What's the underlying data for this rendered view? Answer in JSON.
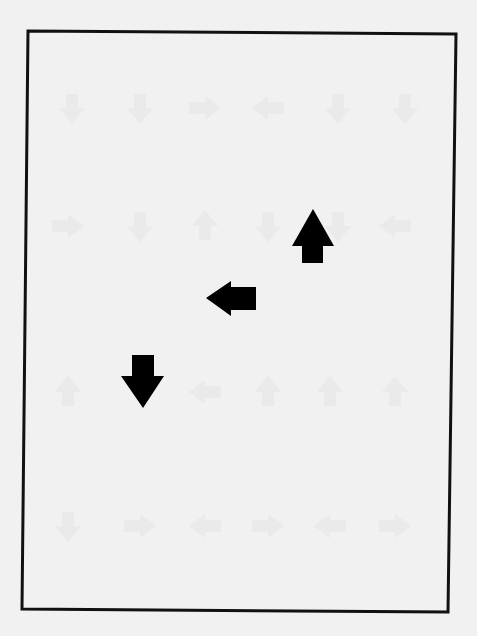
{
  "page": {
    "background": "#f1f1f1",
    "frame": {
      "stroke": "#111111",
      "stroke_width": 3,
      "corners": [
        [
          28,
          31
        ],
        [
          456,
          34
        ],
        [
          448,
          612
        ],
        [
          22,
          609
        ]
      ]
    },
    "arrows": [
      {
        "name": "up-arrow",
        "direction": "up",
        "color": "#000000",
        "points": "313,209 334,246 323,246 323,263 302,263 302,246 292,246"
      },
      {
        "name": "left-arrow",
        "direction": "left",
        "color": "#000000",
        "points": "206,298 231,281 231,287 256,287 256,310 231,310 231,316"
      },
      {
        "name": "down-arrow",
        "direction": "down",
        "color": "#000000",
        "points": "132,355 154,355 154,376 164,376 143,408 121,376 132,376"
      }
    ],
    "ghost_marks": {
      "color": "#e3e3e3",
      "rows": [
        {
          "y": 108,
          "items": [
            {
              "x": 72,
              "dir": "down"
            },
            {
              "x": 140,
              "dir": "down"
            },
            {
              "x": 205,
              "dir": "right"
            },
            {
              "x": 268,
              "dir": "left"
            },
            {
              "x": 338,
              "dir": "down"
            },
            {
              "x": 405,
              "dir": "down"
            }
          ]
        },
        {
          "y": 226,
          "items": [
            {
              "x": 68,
              "dir": "right"
            },
            {
              "x": 140,
              "dir": "down"
            },
            {
              "x": 205,
              "dir": "up"
            },
            {
              "x": 268,
              "dir": "down"
            },
            {
              "x": 338,
              "dir": "down"
            },
            {
              "x": 395,
              "dir": "left"
            }
          ]
        },
        {
          "y": 392,
          "items": [
            {
              "x": 68,
              "dir": "up"
            },
            {
              "x": 205,
              "dir": "left"
            },
            {
              "x": 268,
              "dir": "up"
            },
            {
              "x": 330,
              "dir": "up"
            },
            {
              "x": 395,
              "dir": "up"
            }
          ]
        },
        {
          "y": 526,
          "items": [
            {
              "x": 68,
              "dir": "down"
            },
            {
              "x": 140,
              "dir": "right"
            },
            {
              "x": 205,
              "dir": "left"
            },
            {
              "x": 268,
              "dir": "right"
            },
            {
              "x": 330,
              "dir": "left"
            },
            {
              "x": 395,
              "dir": "right"
            }
          ]
        }
      ]
    }
  }
}
